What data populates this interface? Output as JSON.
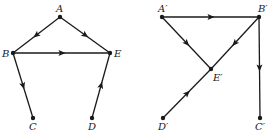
{
  "diagrams": [
    {
      "id": "left-graph",
      "nodes": [
        {
          "id": "A",
          "label": "A",
          "x": 60,
          "y": 17,
          "lx": 56,
          "ly": 12
        },
        {
          "id": "B",
          "label": "B",
          "x": 13,
          "y": 53,
          "lx": 2,
          "ly": 57
        },
        {
          "id": "E",
          "label": "E",
          "x": 110,
          "y": 53,
          "lx": 114,
          "ly": 57
        },
        {
          "id": "C",
          "label": "C",
          "x": 33,
          "y": 118,
          "lx": 29,
          "ly": 130
        },
        {
          "id": "D",
          "label": "D",
          "x": 92,
          "y": 118,
          "lx": 88,
          "ly": 130
        }
      ],
      "edges": [
        {
          "from": "A",
          "to": "B"
        },
        {
          "from": "A",
          "to": "E"
        },
        {
          "from": "B",
          "to": "E"
        },
        {
          "from": "B",
          "to": "C"
        },
        {
          "from": "D",
          "to": "E"
        }
      ]
    },
    {
      "id": "right-graph",
      "nodes": [
        {
          "id": "A'",
          "label": "A′",
          "x": 162,
          "y": 17,
          "lx": 158,
          "ly": 12
        },
        {
          "id": "B'",
          "label": "B′",
          "x": 259,
          "y": 17,
          "lx": 258,
          "ly": 12
        },
        {
          "id": "E'",
          "label": "E′",
          "x": 211,
          "y": 69,
          "lx": 213,
          "ly": 81
        },
        {
          "id": "D'",
          "label": "D′",
          "x": 163,
          "y": 118,
          "lx": 158,
          "ly": 130
        },
        {
          "id": "C'",
          "label": "C′",
          "x": 260,
          "y": 118,
          "lx": 255,
          "ly": 130
        }
      ],
      "edges": [
        {
          "from": "A'",
          "to": "B'"
        },
        {
          "from": "A'",
          "to": "E'"
        },
        {
          "from": "B'",
          "to": "E'"
        },
        {
          "from": "B'",
          "to": "C'"
        },
        {
          "from": "D'",
          "to": "E'"
        }
      ]
    }
  ],
  "colors": {
    "ink": "#1a1a1a",
    "background": "#ffffff"
  }
}
